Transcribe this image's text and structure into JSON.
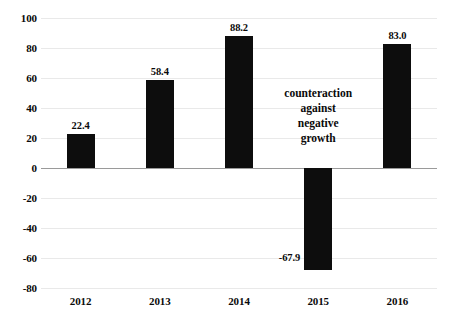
{
  "chart_data": {
    "type": "bar",
    "title": "",
    "subtitle": "",
    "xlabel": "",
    "ylabel": "",
    "categories": [
      "2012",
      "2013",
      "2014",
      "2015",
      "2016"
    ],
    "values": [
      22.4,
      58.4,
      88.2,
      -67.9,
      83.0
    ],
    "value_labels": [
      "22.4",
      "58.4",
      "88.2",
      "-67.9",
      "83.0"
    ],
    "series": [
      {
        "name": "",
        "values": [
          22.4,
          58.4,
          88.2,
          -67.9,
          83.0
        ],
        "color": "#0d0d0d"
      }
    ],
    "ylim": [
      -80,
      100
    ],
    "ytick_step": 20,
    "ytick_labels": [
      "100",
      "80",
      "60",
      "40",
      "20",
      "0",
      "-20",
      "-40",
      "-60",
      "-80"
    ],
    "ytick_values": [
      100,
      80,
      60,
      40,
      20,
      0,
      -20,
      -40,
      -60,
      -80
    ],
    "grid": true,
    "grid_color": "#e9e9e9",
    "zero_line_color": "#9a9a9a",
    "legend": null,
    "legend_position": "none",
    "annotations": [
      {
        "name": "counteraction-note",
        "lines": [
          "counteraction",
          "against",
          "negative",
          "growth"
        ],
        "x_category": "between-2014-and-2016",
        "y_value": 55
      }
    ]
  }
}
